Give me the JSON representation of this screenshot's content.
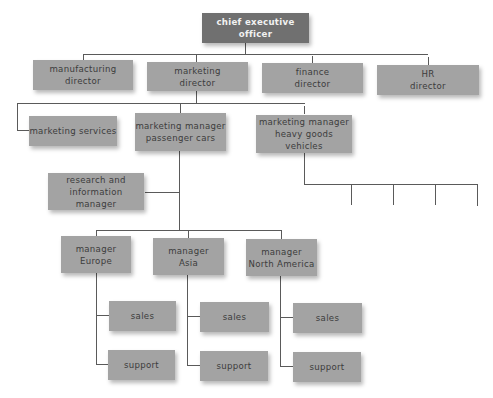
{
  "chart": {
    "ceo": "chief executive officer",
    "directors": [
      {
        "label": "manufacturing\ndirector"
      },
      {
        "label": "marketing\ndirector"
      },
      {
        "label": "finance\ndirector"
      },
      {
        "label": "HR\ndirector"
      }
    ],
    "marketing_reports": [
      {
        "label": "marketing services"
      },
      {
        "label": "marketing manager\npassenger cars"
      },
      {
        "label": "marketing manager\nheavy goods vehicles"
      }
    ],
    "research": "research and\ninformation manager",
    "regional_managers": [
      {
        "label": "manager\nEurope",
        "sales": "sales",
        "support": "support"
      },
      {
        "label": "manager\nAsia",
        "sales": "sales",
        "support": "support"
      },
      {
        "label": "manager\nNorth America",
        "sales": "sales",
        "support": "support"
      }
    ]
  }
}
